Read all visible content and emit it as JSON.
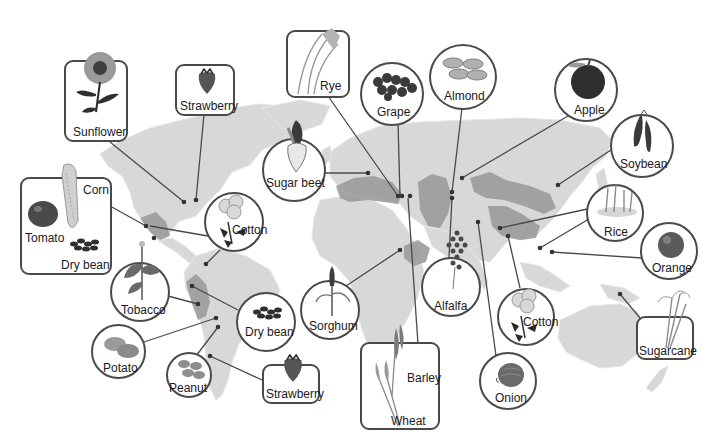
{
  "figure": {
    "colors": {
      "land": "#d8d8d8",
      "origin_region": "#9c9c9c",
      "outline": "#4a4a4a",
      "dot": "#333333",
      "background": "#ffffff"
    }
  },
  "callouts": {
    "sunflower": {
      "label": "Sunflower",
      "shape": "box",
      "icon": "sunflower-icon"
    },
    "strawberry_na": {
      "label": "Strawberry",
      "shape": "box",
      "icon": "strawberry-icon"
    },
    "rye": {
      "label": "Rye",
      "shape": "box",
      "icon": "rye-icon"
    },
    "grape": {
      "label": "Grape",
      "shape": "circle",
      "icon": "grape-icon"
    },
    "almond": {
      "label": "Almond",
      "shape": "circle",
      "icon": "almond-icon"
    },
    "apple": {
      "label": "Apple",
      "shape": "circle",
      "icon": "apple-icon"
    },
    "soybean": {
      "label": "Soybean",
      "shape": "circle",
      "icon": "soybean-icon"
    },
    "sugar_beet": {
      "label": "Sugar beet",
      "shape": "circle",
      "icon": "sugar-beet-icon"
    },
    "mesoamerica": {
      "labels": {
        "corn": "Corn",
        "tomato": "Tomato",
        "dry_bean": "Dry bean"
      },
      "shape": "box"
    },
    "cotton_am": {
      "label": "Cotton",
      "shape": "circle",
      "icon": "cotton-icon"
    },
    "rice": {
      "label": "Rice",
      "shape": "circle",
      "icon": "rice-icon"
    },
    "orange": {
      "label": "Orange",
      "shape": "circle",
      "icon": "orange-icon"
    },
    "tobacco": {
      "label": "Tobacco",
      "shape": "circle",
      "icon": "tobacco-icon"
    },
    "dry_bean_sa": {
      "label": "Dry bean",
      "shape": "circle",
      "icon": "dry-bean-icon"
    },
    "sorghum": {
      "label": "Sorghum",
      "shape": "circle",
      "icon": "sorghum-icon"
    },
    "alfalfa": {
      "label": "Alfalfa",
      "shape": "circle",
      "icon": "alfalfa-icon"
    },
    "cotton_as": {
      "label": "Cotton",
      "shape": "circle",
      "icon": "cotton-icon"
    },
    "potato": {
      "label": "Potato",
      "shape": "circle",
      "icon": "potato-icon"
    },
    "peanut": {
      "label": "Peanut",
      "shape": "circle",
      "icon": "peanut-icon"
    },
    "strawberry_sa": {
      "label": "Strawberry",
      "shape": "box",
      "icon": "strawberry-icon"
    },
    "barley_wheat": {
      "labels": {
        "barley": "Barley",
        "wheat": "Wheat"
      },
      "shape": "box"
    },
    "onion": {
      "label": "Onion",
      "shape": "circle",
      "icon": "onion-icon"
    },
    "sugarcane": {
      "label": "Sugarcane",
      "shape": "box",
      "icon": "sugarcane-icon"
    }
  }
}
